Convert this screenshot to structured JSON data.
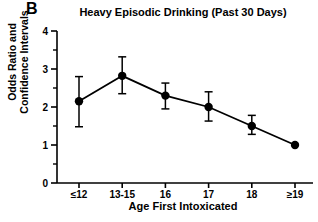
{
  "figure": {
    "panel_label": "B",
    "background_color": "#ffffff",
    "ink_color": "#000000"
  },
  "chart_data": {
    "type": "line",
    "title": "Heavy Episodic Drinking (Past 30 Days)",
    "xlabel": "Age First Intoxicated",
    "ylabel": "Odds Ratio and Confidence Intervals",
    "ylabel_lines": [
      "Odds Ratio and",
      "Confidence Intervals"
    ],
    "categories": [
      "≤12",
      "13-15",
      "16",
      "17",
      "18",
      "≥19"
    ],
    "values": [
      2.15,
      2.82,
      2.3,
      2.0,
      1.5,
      1.0
    ],
    "ci_lower": [
      1.48,
      2.35,
      1.95,
      1.63,
      1.28,
      1.0
    ],
    "ci_upper": [
      2.8,
      3.32,
      2.63,
      2.4,
      1.78,
      1.0
    ],
    "ylim": [
      0,
      4
    ],
    "ytick_labels": [
      "0",
      "1",
      "2",
      "3",
      "4"
    ],
    "ytick_values": [
      0,
      1,
      2,
      3,
      4
    ],
    "yminor_values": [
      0.5,
      1.5,
      2.5,
      3.5
    ],
    "grid": false,
    "legend": null,
    "marker": "filled-circle",
    "series_name": "Odds Ratio"
  }
}
